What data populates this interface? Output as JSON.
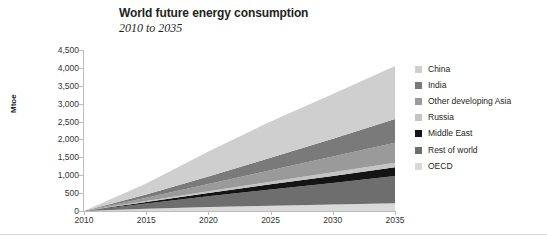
{
  "chart_data": {
    "type": "area",
    "title": "World future energy consumption",
    "subtitle": "2010 to 2035",
    "xlabel": "",
    "ylabel": "Mtoe",
    "grid": false,
    "stacked": true,
    "legend_position": "right",
    "xlim": [
      2010,
      2035
    ],
    "ylim": [
      0,
      4500
    ],
    "yticks": [
      "0",
      "500",
      "1,000",
      "1,500",
      "2,000",
      "2,500",
      "3,000",
      "3,500",
      "4,000",
      "4,500"
    ],
    "ytick_values": [
      0,
      500,
      1000,
      1500,
      2000,
      2500,
      3000,
      3500,
      4000,
      4500
    ],
    "xticks": [
      "2010",
      "2015",
      "2020",
      "2025",
      "2030",
      "2035"
    ],
    "xtick_values": [
      2010,
      2015,
      2020,
      2025,
      2030,
      2035
    ],
    "x": [
      2010,
      2015,
      2020,
      2025,
      2030,
      2035
    ],
    "series": [
      {
        "name": "OECD",
        "color": "#d9d9d9",
        "stack_order": 1,
        "values": [
          0,
          60,
          110,
          150,
          185,
          215
        ]
      },
      {
        "name": "Rest of world",
        "color": "#6e6e6e",
        "stack_order": 2,
        "values": [
          0,
          150,
          300,
          450,
          600,
          760
        ]
      },
      {
        "name": "Middle East",
        "color": "#141414",
        "stack_order": 3,
        "values": [
          0,
          45,
          95,
          145,
          195,
          250
        ]
      },
      {
        "name": "Russia",
        "color": "#c4c4c4",
        "stack_order": 4,
        "values": [
          0,
          25,
          50,
          75,
          100,
          125
        ]
      },
      {
        "name": "Other developing Asia",
        "color": "#9a9a9a",
        "stack_order": 5,
        "values": [
          0,
          90,
          200,
          320,
          440,
          560
        ]
      },
      {
        "name": "India",
        "color": "#7a7a7a",
        "stack_order": 6,
        "values": [
          0,
          90,
          210,
          350,
          500,
          660
        ]
      },
      {
        "name": "China",
        "color": "#cfcfcf",
        "stack_order": 7,
        "values": [
          0,
          310,
          700,
          1010,
          1250,
          1480
        ]
      }
    ],
    "totals": [
      0,
      770,
      1665,
      2500,
      3270,
      4050
    ]
  },
  "legend": {
    "items": [
      {
        "label": "China",
        "color": "#cfcfcf"
      },
      {
        "label": "India",
        "color": "#7a7a7a"
      },
      {
        "label": "Other developing Asia",
        "color": "#9a9a9a"
      },
      {
        "label": "Russia",
        "color": "#c4c4c4"
      },
      {
        "label": "Middle East",
        "color": "#141414"
      },
      {
        "label": "Rest of world",
        "color": "#6e6e6e"
      },
      {
        "label": "OECD",
        "color": "#d9d9d9"
      }
    ]
  }
}
